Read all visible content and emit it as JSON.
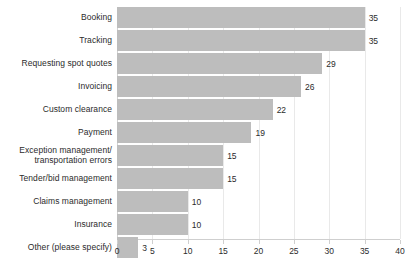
{
  "chart_data": {
    "type": "bar",
    "orientation": "horizontal",
    "title": "",
    "xlabel": "",
    "ylabel": "",
    "xlim": [
      0,
      40
    ],
    "xticks": [
      0,
      5,
      10,
      15,
      20,
      25,
      30,
      35,
      40
    ],
    "grid": "vertical",
    "legend": "none",
    "bar_color": "#bdbdbd",
    "categories": [
      "Booking",
      "Tracking",
      "Requesting spot quotes",
      "Invoicing",
      "Custom clearance",
      "Payment",
      "Exception management/\ntransportation errors",
      "Tender/bid management",
      "Claims management",
      "Insurance",
      "Other (please specify)"
    ],
    "values": [
      35,
      35,
      29,
      26,
      22,
      19,
      15,
      15,
      10,
      10,
      3
    ],
    "value_labels": [
      "35",
      "35",
      "29",
      "26",
      "22",
      "19",
      "15",
      "15",
      "10",
      "10",
      "3"
    ],
    "xtick_labels": [
      "0",
      "5",
      "10",
      "15",
      "20",
      "25",
      "30",
      "35",
      "40"
    ]
  }
}
